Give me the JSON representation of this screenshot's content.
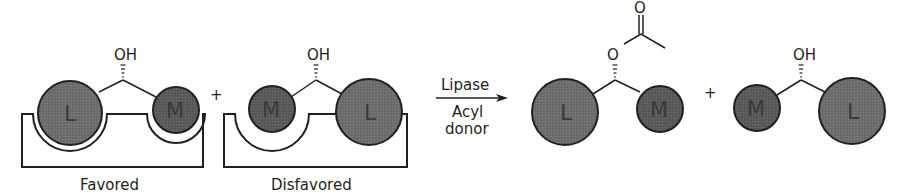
{
  "diagram": {
    "colors": {
      "ball_fill": "#6e6e6e",
      "ball_fill_dark": "#5a5a5a",
      "stroke": "#231f20",
      "text": "#231f20"
    },
    "substituents": {
      "large": "L",
      "medium": "M"
    },
    "hydroxyl_label": "OH",
    "ester_oxygen_label": "O",
    "carbonyl_oxygen_label": "O",
    "plus_sign": "+",
    "complexes": [
      {
        "label": "Favored",
        "left_group": "L",
        "right_group": "M",
        "group_label": "OH"
      },
      {
        "label": "Disfavored",
        "left_group": "M",
        "right_group": "L",
        "group_label": "OH"
      }
    ],
    "reaction_arrow": {
      "above": "Lipase",
      "below_line1": "Acyl",
      "below_line2": "donor"
    },
    "products": [
      {
        "name": "acylated-ester",
        "left_group": "L",
        "right_group": "M",
        "group_label": "O"
      },
      {
        "name": "unreacted-alcohol",
        "left_group": "M",
        "right_group": "L",
        "group_label": "OH"
      }
    ]
  }
}
